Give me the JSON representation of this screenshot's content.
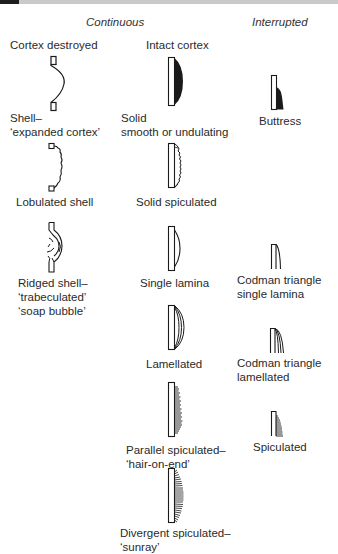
{
  "headers": {
    "continuous": "Continuous",
    "interrupted": "Interrupted"
  },
  "columns": {
    "cortex_destroyed": {
      "title": "Cortex destroyed",
      "items": [
        {
          "line1": "Shell–",
          "line2": "‘expanded cortex’"
        },
        {
          "line1": "Lobulated shell"
        },
        {
          "line1": "Ridged shell–",
          "line2": "‘trabeculated’",
          "line3": "‘soap bubble’"
        }
      ]
    },
    "intact_cortex": {
      "title": "Intact cortex",
      "items": [
        {
          "line1": "Solid",
          "line2": "smooth or undulating"
        },
        {
          "line1": "Solid spiculated"
        },
        {
          "line1": "Single lamina"
        },
        {
          "line1": "Lamellated"
        },
        {
          "line1": "Parallel spiculated–",
          "line2": "‘hair-on-end’"
        },
        {
          "line1": "Divergent spiculated–",
          "line2": "‘sunray’"
        }
      ]
    },
    "interrupted": {
      "items": [
        {
          "line1": "Buttress"
        },
        {
          "line1": "Codman triangle",
          "line2": "single lamina"
        },
        {
          "line1": "Codman triangle",
          "line2": "lamellated"
        },
        {
          "line1": "Spiculated"
        }
      ]
    }
  },
  "colors": {
    "ink": "#1a1a1a",
    "background": "#ffffff"
  }
}
